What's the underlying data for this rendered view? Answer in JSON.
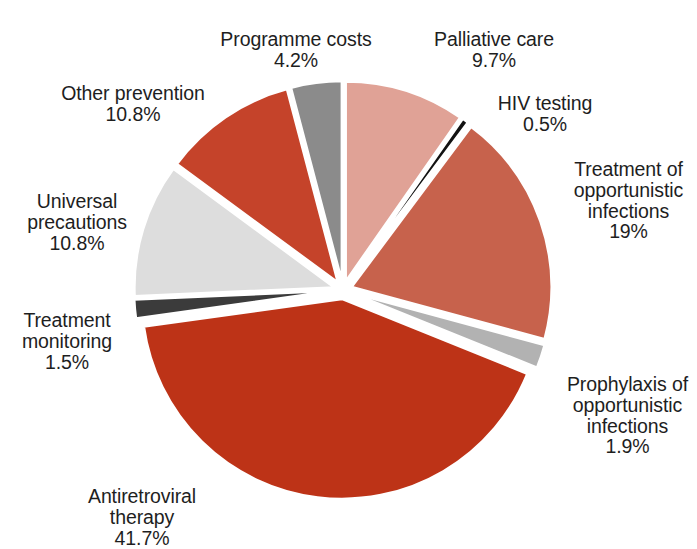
{
  "chart_data": {
    "type": "pie",
    "title": "",
    "subtitle": "",
    "xlabel": "",
    "ylabel": "",
    "exploded": true,
    "legend_position": "none",
    "units": "percent",
    "total": 100,
    "categories": [
      "Palliative care",
      "HIV testing",
      "Treatment of opportunistic infections",
      "Prophylaxis of opportunistic infections",
      "Antiretroviral therapy",
      "Treatment monitoring",
      "Universal precautions",
      "Other prevention",
      "Programme costs"
    ],
    "values": [
      9.7,
      0.5,
      19,
      1.9,
      41.7,
      1.5,
      10.8,
      10.8,
      4.2
    ],
    "value_labels": [
      "9.7%",
      "0.5%",
      "19%",
      "1.9%",
      "41.7%",
      "1.5%",
      "10.8%",
      "10.8%",
      "4.2%"
    ],
    "colors": [
      "#e0a296",
      "#121212",
      "#c7624c",
      "#b2b2b2",
      "#bd3317",
      "#3b3b3b",
      "#dddddd",
      "#c5432a",
      "#8b8b8b"
    ],
    "slices": [
      {
        "name": "Palliative care",
        "label": "Palliative care",
        "value_label": "9.7%",
        "value": 9.7,
        "color": "#e0a296",
        "start_deg": 0.0,
        "end_deg": 34.92
      },
      {
        "name": "HIV testing",
        "label": "HIV testing",
        "value_label": "0.5%",
        "value": 0.5,
        "color": "#121212",
        "start_deg": 34.92,
        "end_deg": 36.72
      },
      {
        "name": "Treatment of opportunistic infections",
        "label": "Treatment of\nopportunistic\ninfections",
        "value_label": "19%",
        "value": 19,
        "color": "#c7624c",
        "start_deg": 36.72,
        "end_deg": 105.12
      },
      {
        "name": "Prophylaxis of opportunistic infections",
        "label": "Prophylaxis of\nopportunistic\ninfections",
        "value_label": "1.9%",
        "value": 1.9,
        "color": "#b2b2b2",
        "start_deg": 105.12,
        "end_deg": 111.96
      },
      {
        "name": "Antiretroviral therapy",
        "label": "Antiretroviral\ntherapy",
        "value_label": "41.7%",
        "value": 41.7,
        "color": "#bd3317",
        "start_deg": 111.96,
        "end_deg": 262.08
      },
      {
        "name": "Treatment monitoring",
        "label": "Treatment\nmonitoring",
        "value_label": "1.5%",
        "value": 1.5,
        "color": "#3b3b3b",
        "start_deg": 262.08,
        "end_deg": 267.48
      },
      {
        "name": "Universal precautions",
        "label": "Universal\nprecautions",
        "value_label": "10.8%",
        "value": 10.8,
        "color": "#dddddd",
        "start_deg": 267.48,
        "end_deg": 306.36
      },
      {
        "name": "Other prevention",
        "label": "Other prevention",
        "value_label": "10.8%",
        "value": 10.8,
        "color": "#c5432a",
        "start_deg": 306.36,
        "end_deg": 345.24
      },
      {
        "name": "Programme costs",
        "label": "Programme costs",
        "value_label": "4.2%",
        "value": 4.2,
        "color": "#8b8b8b",
        "start_deg": 345.24,
        "end_deg": 360.0
      }
    ]
  },
  "labels": {
    "programme_costs": {
      "name": "Programme costs",
      "value": "4.2%"
    },
    "palliative_care": {
      "name": "Palliative care",
      "value": "9.7%"
    },
    "other_prevention": {
      "name": "Other prevention",
      "value": "10.8%"
    },
    "hiv_testing": {
      "name": "HIV testing",
      "value": "0.5%"
    },
    "opportunistic_treatment": {
      "name": "Treatment of\nopportunistic\ninfections",
      "value": "19%"
    },
    "universal_precautions": {
      "name": "Universal\nprecautions",
      "value": "10.8%"
    },
    "treatment_monitoring": {
      "name": "Treatment\nmonitoring",
      "value": "1.5%"
    },
    "prophylaxis": {
      "name": "Prophylaxis of\nopportunistic\ninfections",
      "value": "1.9%"
    },
    "antiretroviral_therapy": {
      "name": "Antiretroviral\ntherapy",
      "value": "41.7%"
    }
  },
  "geometry": {
    "cx": 343,
    "cy": 290,
    "radius": 200,
    "explode": 9
  }
}
